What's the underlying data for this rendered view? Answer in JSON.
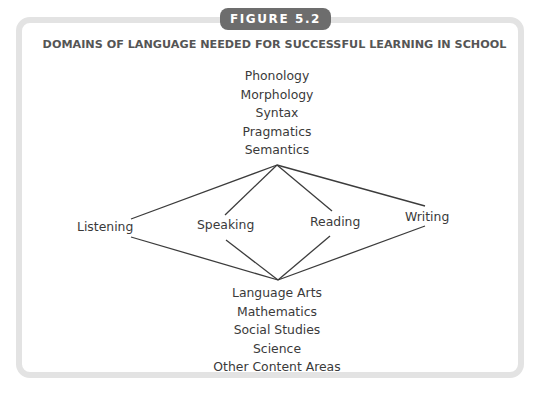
{
  "figure": {
    "label": "FIGURE 5.2",
    "title": "DOMAINS OF LANGUAGE NEEDED FOR SUCCESSFUL LEARNING IN SCHOOL"
  },
  "language_domains": [
    "Phonology",
    "Morphology",
    "Syntax",
    "Pragmatics",
    "Semantics"
  ],
  "modalities": [
    "Listening",
    "Speaking",
    "Reading",
    "Writing"
  ],
  "content_areas": [
    "Language Arts",
    "Mathematics",
    "Social Studies",
    "Science",
    "Other Content Areas"
  ],
  "colors": {
    "tab_background": "#6d6d6d",
    "frame_border": "#e3e3e3",
    "line": "#3c3c3c",
    "text": "#3a3a3a"
  }
}
